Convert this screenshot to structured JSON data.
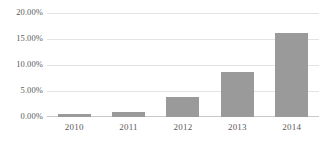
{
  "chart_data": {
    "type": "bar",
    "title": "",
    "xlabel": "",
    "ylabel": "",
    "categories": [
      "2010",
      "2011",
      "2012",
      "2013",
      "2014"
    ],
    "values": [
      0.6,
      1.0,
      3.8,
      8.7,
      16.2
    ],
    "value_labels": [
      "0.60%",
      "1.00%",
      "3.80%",
      "8.70%",
      "16.20%"
    ],
    "ylim": [
      0,
      20
    ],
    "y_ticks": [
      20,
      15,
      10,
      5,
      0
    ],
    "y_tick_labels": [
      "20.00%",
      "15.00%",
      "10.00%",
      "5.00%",
      "0.00%"
    ],
    "grid": true,
    "grid_axis": "y",
    "legend": false,
    "legend_position": "none",
    "series": [
      {
        "name": "",
        "values": [
          0.6,
          1.0,
          3.8,
          8.7,
          16.2
        ],
        "color": "#9a9a9a"
      }
    ]
  },
  "colors": {
    "bar": "#9a9a9a",
    "gridline": "#e3e3e3",
    "axis_line": "#c9c9c9",
    "tick_label": "#5a5a5a",
    "background": "#ffffff"
  }
}
